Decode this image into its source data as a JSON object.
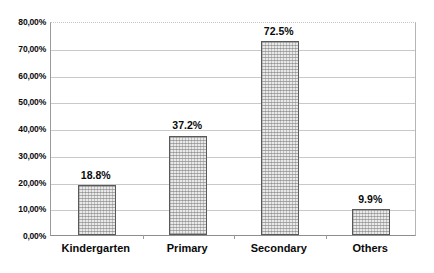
{
  "chart_data": {
    "type": "bar",
    "title": "",
    "subtitle": "",
    "xlabel": "",
    "ylabel": "",
    "categories": [
      "Kindergarten",
      "Primary",
      "Secondary",
      "Others"
    ],
    "values": [
      18.8,
      37.2,
      72.5,
      9.9
    ],
    "value_labels": [
      "18.8%",
      "37.2%",
      "72.5%",
      "9.9%"
    ],
    "ylim": [
      0,
      80
    ],
    "ytick_step": 10,
    "ytick_labels": [
      "80,00%",
      "70,00%",
      "60,00%",
      "50,00%",
      "40,00%",
      "30,00%",
      "20,00%",
      "10,00%",
      "0,00%"
    ],
    "ytick_values": [
      80,
      70,
      60,
      50,
      40,
      30,
      20,
      10,
      0
    ],
    "grid": true,
    "legend": "none",
    "colors": {
      "bar_fill": "#e9e9e9",
      "bar_border": "#59595b",
      "gridline": "#c9c9c9",
      "axis": "#8e8e8e",
      "text": "#0a0a0a",
      "background": "#ffffff"
    }
  }
}
